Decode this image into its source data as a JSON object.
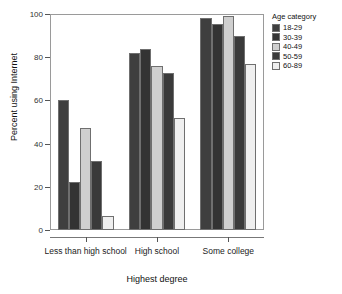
{
  "chart_data": {
    "type": "bar",
    "title": "",
    "xlabel": "Highest degree",
    "ylabel": "Percent using Internet",
    "categories": [
      "Less than high school",
      "High school",
      "Some college"
    ],
    "ylim": [
      0,
      100
    ],
    "yticks": [
      0,
      20,
      40,
      60,
      80,
      100
    ],
    "ytick_labels": [
      "0",
      "20",
      "40",
      "60",
      "80",
      "100"
    ],
    "grid": false,
    "legend_position": "right",
    "legend_title": "Age category",
    "series": [
      {
        "name": "18-29",
        "color": "#3f3f3f",
        "values": [
          60,
          82,
          98
        ]
      },
      {
        "name": "30-39",
        "color": "#333333",
        "values": [
          22,
          84,
          95.5
        ]
      },
      {
        "name": "40-49",
        "color": "#cfcfcf",
        "values": [
          47,
          76,
          99
        ]
      },
      {
        "name": "50-59",
        "color": "#3a3a3a",
        "values": [
          32,
          72.5,
          90
        ]
      },
      {
        "name": "60-89",
        "color": "#efefef",
        "values": [
          6.5,
          52,
          77
        ]
      }
    ]
  }
}
